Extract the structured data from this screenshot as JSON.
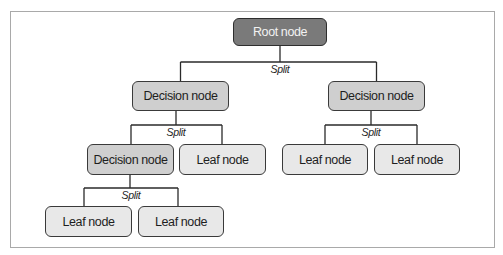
{
  "diagram": {
    "type": "decision-tree",
    "frame_color": "#a9a9a9",
    "colors": {
      "root_fill": "#7a7a7a",
      "root_text": "#f2f2f2",
      "decision_fill": "#cfcfcf",
      "leaf_fill": "#e8e8e8",
      "border": "#3a3a3a",
      "edge": "#2a2a2a"
    },
    "nodes": [
      {
        "id": "root",
        "kind": "root",
        "label": "Root node",
        "x": 233,
        "y": 18,
        "w": 94,
        "h": 28
      },
      {
        "id": "d1",
        "kind": "decision",
        "label": "Decision node",
        "x": 132,
        "y": 81,
        "w": 97,
        "h": 30
      },
      {
        "id": "d2",
        "kind": "decision",
        "label": "Decision node",
        "x": 328,
        "y": 81,
        "w": 97,
        "h": 30
      },
      {
        "id": "d3",
        "kind": "decision",
        "label": "Decision node",
        "x": 87,
        "y": 144,
        "w": 87,
        "h": 31
      },
      {
        "id": "l1",
        "kind": "leaf",
        "label": "Leaf node",
        "x": 179,
        "y": 144,
        "w": 87,
        "h": 31
      },
      {
        "id": "l2",
        "kind": "leaf",
        "label": "Leaf node",
        "x": 282,
        "y": 144,
        "w": 86,
        "h": 31
      },
      {
        "id": "l3",
        "kind": "leaf",
        "label": "Leaf node",
        "x": 374,
        "y": 144,
        "w": 86,
        "h": 31
      },
      {
        "id": "l4",
        "kind": "leaf",
        "label": "Leaf node",
        "x": 45,
        "y": 206,
        "w": 87,
        "h": 31
      },
      {
        "id": "l5",
        "kind": "leaf",
        "label": "Leaf node",
        "x": 138,
        "y": 206,
        "w": 86,
        "h": 31
      }
    ],
    "splits": [
      {
        "label": "Split",
        "parent": "root",
        "children": [
          "d1",
          "d2"
        ],
        "label_x": 280,
        "label_y": 63
      },
      {
        "label": "Split",
        "parent": "d1",
        "children": [
          "d3",
          "l1"
        ],
        "label_x": 176,
        "label_y": 126
      },
      {
        "label": "Split",
        "parent": "d2",
        "children": [
          "l2",
          "l3"
        ],
        "label_x": 371,
        "label_y": 126
      },
      {
        "label": "Split",
        "parent": "d3",
        "children": [
          "l4",
          "l5"
        ],
        "label_x": 131,
        "label_y": 189
      }
    ]
  }
}
